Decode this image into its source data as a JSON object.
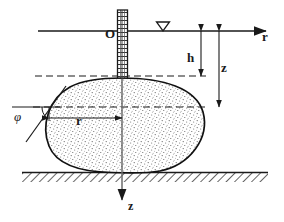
{
  "figure": {
    "kind": "engineering-cross-section-diagram",
    "background_color": "#ffffff",
    "line_color": "#1a1a1a"
  },
  "labels": {
    "origin": "O",
    "r_axis": "r",
    "h_dimension": "h",
    "z_dimension": "z",
    "r_dimension": "r",
    "phi_angle": "φ",
    "z_axis": "z"
  },
  "elements": {
    "horizontal_axis_name": "r-axis",
    "vertical_axis_name": "z-axis",
    "water_table_marker": "inverted-triangle",
    "pipe_name": "borehole-pipe",
    "bulb_name": "injection-bulb",
    "ground_name": "ground-hatch-strip",
    "dashed_upper_name": "bulb-crown-dashed-line",
    "dashed_lower_name": "bulb-radius-dashed-line",
    "tangent_name": "tangent-line"
  },
  "geometry": {
    "axis_y": 31,
    "axis_x_start": 38,
    "axis_x_end": 272,
    "origin_x": 122,
    "z_axis_bottom": 205,
    "pipe_top": 10,
    "pipe_bottom": 78,
    "pipe_left": 117,
    "pipe_right": 128,
    "water_marker_x": 163,
    "bulb_center_x": 122,
    "bulb_top": 78,
    "bulb_bottom": 172,
    "bulb_left": 47,
    "bulb_right": 205,
    "dashed_upper_y": 76,
    "dashed_lower_y": 107,
    "h_dim_x": 201,
    "z_dim_x": 219,
    "ground_top": 172,
    "ground_bottom": 182,
    "ground_left": 22,
    "ground_right": 268
  }
}
